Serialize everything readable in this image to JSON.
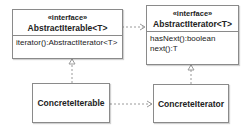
{
  "diagram": {
    "type": "uml-class-diagram",
    "classes": [
      {
        "id": "abstract_iterable",
        "stereotype": "«interface»",
        "name": "AbstractIterable<T>",
        "members": [
          "iterator():AbstractIterator<T>"
        ]
      },
      {
        "id": "abstract_iterator",
        "stereotype": "«interface»",
        "name": "AbstractIterator<T>",
        "members": [
          "hasNext():boolean",
          "next():T"
        ]
      },
      {
        "id": "concrete_iterable",
        "name": "ConcreteIterable"
      },
      {
        "id": "concrete_iterator",
        "name": "ConcreteIterator"
      }
    ],
    "relations": [
      {
        "from": "abstract_iterable",
        "to": "abstract_iterator",
        "type": "dependency"
      },
      {
        "from": "concrete_iterable",
        "to": "abstract_iterable",
        "type": "realization"
      },
      {
        "from": "concrete_iterator",
        "to": "abstract_iterator",
        "type": "realization"
      },
      {
        "from": "concrete_iterable",
        "to": "concrete_iterator",
        "type": "dependency"
      }
    ],
    "colors": {
      "border": "#8a8a8a",
      "line": "#8a8a8a",
      "text": "#222222"
    }
  }
}
